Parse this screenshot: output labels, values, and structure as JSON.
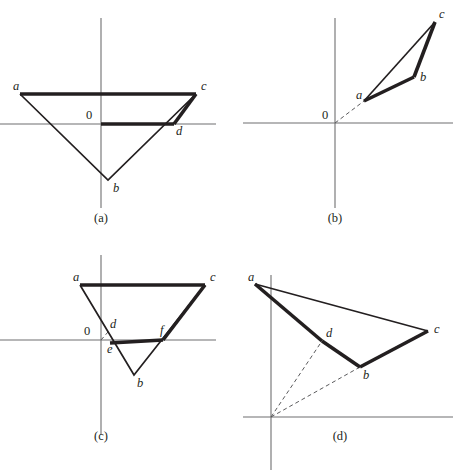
{
  "figure": {
    "background_color": "#ffffff",
    "ink_color": "#231f20",
    "axis_color": "#6f6f70",
    "dash_color": "#5a5a5c",
    "width": 453,
    "height": 470
  },
  "panels": [
    {
      "id": "a",
      "caption": "(a)",
      "caption_pos": {
        "x": 101,
        "y": 222
      },
      "origin": {
        "x": 101,
        "y": 124
      },
      "origin_label": "0",
      "origin_label_pos": {
        "x": 86,
        "y": 119
      },
      "axes": {
        "x_axis": {
          "x1": 0,
          "y1": 124,
          "x2": 216,
          "y2": 124
        },
        "y_axis": {
          "x1": 101,
          "y1": 18,
          "x2": 101,
          "y2": 208
        }
      },
      "vertices": [
        {
          "name": "a",
          "x": 20,
          "y": 94,
          "label_x": 13,
          "label_y": 90
        },
        {
          "name": "c",
          "x": 196,
          "y": 94,
          "label_x": 201,
          "label_y": 90
        },
        {
          "name": "d",
          "x": 174,
          "y": 124,
          "label_x": 176,
          "label_y": 135
        },
        {
          "name": "b",
          "x": 108,
          "y": 180,
          "label_x": 113,
          "label_y": 192
        }
      ],
      "thin_path": "M 20 94 L 108 180 L 196 94",
      "thick_paths": [
        "M 20 94 L 196 94",
        "M 101 124 L 174 124",
        "M 196 94 L 174 124"
      ],
      "dashed_paths": []
    },
    {
      "id": "b",
      "caption": "(b)",
      "caption_pos": {
        "x": 335,
        "y": 222
      },
      "origin": {
        "x": 335,
        "y": 123
      },
      "origin_label": "0",
      "origin_label_pos": {
        "x": 322,
        "y": 119
      },
      "axes": {
        "x_axis": {
          "x1": 243,
          "y1": 123,
          "x2": 453,
          "y2": 123
        },
        "y_axis": {
          "x1": 335,
          "y1": 18,
          "x2": 335,
          "y2": 208
        }
      },
      "vertices": [
        {
          "name": "a",
          "x": 364,
          "y": 101,
          "label_x": 356,
          "label_y": 99
        },
        {
          "name": "b",
          "x": 414,
          "y": 77,
          "label_x": 420,
          "label_y": 81
        },
        {
          "name": "c",
          "x": 435,
          "y": 22,
          "label_x": 439,
          "label_y": 18
        }
      ],
      "thin_path": "M 364 101 L 435 22",
      "thick_paths": [
        "M 364 101 L 414 77",
        "M 414 77 L 435 22"
      ],
      "dashed_paths": [
        "M 335 123 L 364 101"
      ]
    },
    {
      "id": "c",
      "caption": "(c)",
      "caption_pos": {
        "x": 101,
        "y": 440
      },
      "origin": {
        "x": 101,
        "y": 340
      },
      "origin_label": "0",
      "origin_label_pos": {
        "x": 84,
        "y": 335
      },
      "axes": {
        "x_axis": {
          "x1": 0,
          "y1": 340,
          "x2": 216,
          "y2": 340
        },
        "y_axis": {
          "x1": 101,
          "y1": 255,
          "x2": 101,
          "y2": 435
        }
      },
      "vertices": [
        {
          "name": "a",
          "x": 80,
          "y": 285,
          "label_x": 73,
          "label_y": 281
        },
        {
          "name": "c",
          "x": 205,
          "y": 285,
          "label_x": 210,
          "label_y": 281
        },
        {
          "name": "d",
          "x": 108,
          "y": 332,
          "label_x": 110,
          "label_y": 328
        },
        {
          "name": "f",
          "x": 163,
          "y": 340,
          "label_x": 160,
          "label_y": 334
        },
        {
          "name": "e",
          "x": 110,
          "y": 343,
          "label_x": 107,
          "label_y": 353
        },
        {
          "name": "b",
          "x": 134,
          "y": 375,
          "label_x": 137,
          "label_y": 387
        }
      ],
      "thin_path": "M 80 285 L 134 375 L 205 285",
      "thick_paths": [
        "M 80 285 L 205 285",
        "M 110 343 L 163 340",
        "M 205 285 L 163 340"
      ],
      "dashed_paths": [
        "M 101 340 L 108 332"
      ]
    },
    {
      "id": "d",
      "caption": "(d)",
      "caption_pos": {
        "x": 340,
        "y": 440
      },
      "origin": {
        "x": 271,
        "y": 417
      },
      "origin_label": "",
      "origin_label_pos": {
        "x": 258,
        "y": 412
      },
      "axes": {
        "x_axis": {
          "x1": 243,
          "y1": 417,
          "x2": 453,
          "y2": 417
        },
        "y_axis": {
          "x1": 271,
          "y1": 275,
          "x2": 271,
          "y2": 472
        }
      },
      "vertices": [
        {
          "name": "a",
          "x": 255,
          "y": 284,
          "label_x": 248,
          "label_y": 281
        },
        {
          "name": "c",
          "x": 428,
          "y": 331,
          "label_x": 434,
          "label_y": 333
        },
        {
          "name": "d",
          "x": 322,
          "y": 341,
          "label_x": 326,
          "label_y": 337
        },
        {
          "name": "b",
          "x": 360,
          "y": 367,
          "label_x": 363,
          "label_y": 379
        }
      ],
      "thin_path": "M 255 284 L 428 331",
      "thick_paths": [
        "M 255 284 L 322 341",
        "M 322 341 L 360 367",
        "M 360 367 L 428 331"
      ],
      "dashed_paths": [
        "M 271 417 L 322 341",
        "M 271 417 L 360 367"
      ]
    }
  ]
}
